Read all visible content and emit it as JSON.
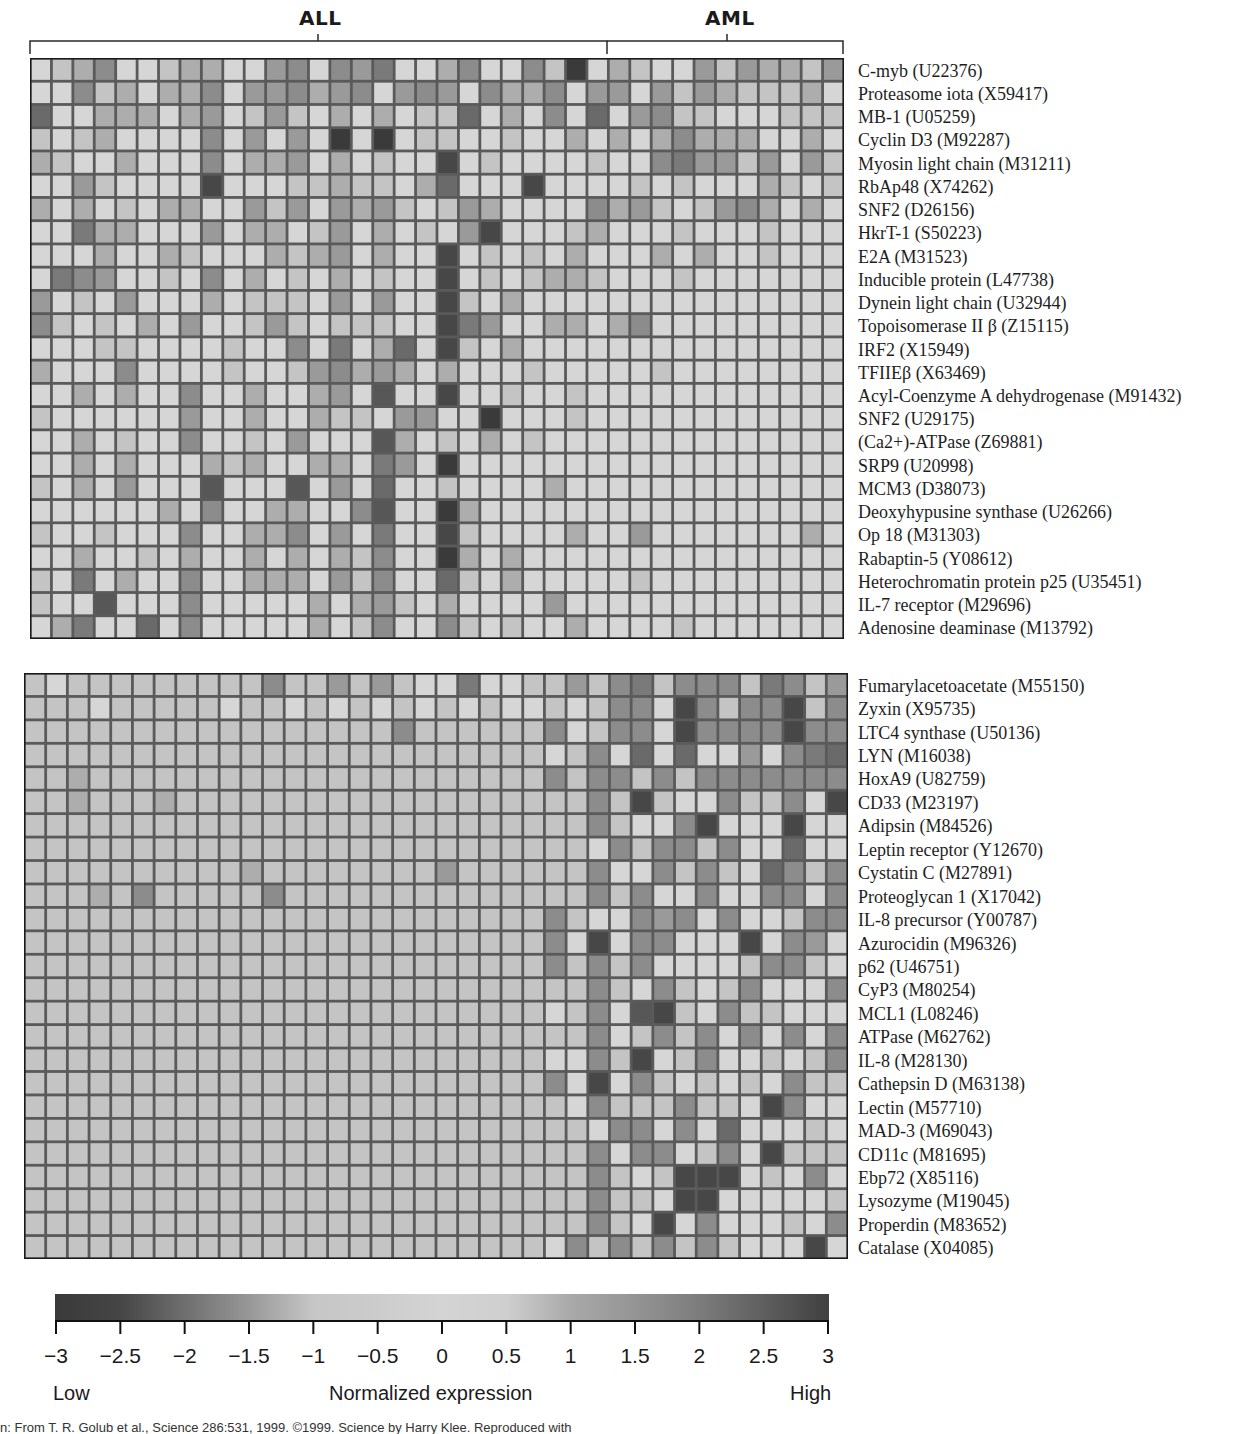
{
  "groups": {
    "left": {
      "label": "ALL",
      "n_columns": 27
    },
    "right": {
      "label": "AML",
      "n_columns": 11
    }
  },
  "top_panel": {
    "genes": [
      "C-myb (U22376)",
      "Proteasome iota (X59417)",
      "MB-1 (U05259)",
      "Cyclin D3 (M92287)",
      "Myosin light chain (M31211)",
      "RbAp48 (X74262)",
      "SNF2 (D26156)",
      "HkrT-1 (S50223)",
      "E2A (M31523)",
      "Inducible protein (L47738)",
      "Dynein light chain (U32944)",
      "Topoisomerase II β (Z15115)",
      "IRF2 (X15949)",
      "TFIIEβ (X63469)",
      "Acyl-Coenzyme A dehydrogenase (M91432)",
      "SNF2 (U29175)",
      "(Ca2+)-ATPase (Z69881)",
      "SRP9 (U20998)",
      "MCM3 (D38073)",
      "Deoxyhypusine synthase (U26266)",
      "Op 18 (M31303)",
      "Rabaptin-5 (Y08612)",
      "Heterochromatin protein p25 (U35451)",
      "IL-7 receptor (M29696)",
      "Adenosine deaminase (M13792)"
    ],
    "levels": [
      "0124001220034043500240041902100313221342",
      "0041202240334234034304224033031321112020",
      "6002220230131020201160204060341100011110",
      "1012000040303090901100100202024222002000",
      "2100200040223020100801000010045331303113",
      "0031000080001121102600080000101000210102",
      "2020102200313032310132000042310134202001",
      "0052200030220130201038000120001000100000",
      "0002002100021230200801010200020200100000",
      "0543001040201020100801012210001000000000",
      "3010300020111030300810200000000000000000",
      "4101020300131011100853002202400000000000",
      "0001100001004050260810200000000000000000",
      "2000400001001342320200010000010000000000",
      "0020200400200230700800100100000000000000",
      "1000000300200211033009000100000000000000",
      "0020100400103000720102010000000000000000",
      "0020200021200220530900000000000000000000",
      "1020300070007030600100002000000000000000",
      "0000002040022004700920000000000000000000",
      "1001000400224030500810000200300000002000",
      "0020010200202021400920200000000000000000",
      "1050200400222031400610200000100000000000",
      "1007000400000202310200003000000000000000",
      "0250060400000201400410100200001000000000"
    ]
  },
  "bottom_panel": {
    "genes": [
      "Fumarylacetoacetate (M55150)",
      "Zyxin (X95735)",
      "LTC4 synthase (U50136)",
      "LYN (M16038)",
      "HoxA9 (U82759)",
      "CD33 (M23197)",
      "Adipsin (M84526)",
      "Leptin receptor (Y12670)",
      "Cystatin C (M27891)",
      "Proteoglycan 1 (X17042)",
      "IL-8 precursor (Y00787)",
      "Azurocidin (M96326)",
      "p62 (U46751)",
      "CyP3 (M80254)",
      "MCL1 (L08246)",
      "ATPase (M62762)",
      "IL-8 (M28130)",
      "Cathepsin D (M63138)",
      "Lectin (M57710)",
      "MAD-3 (M69043)",
      "CD11c (M81695)",
      "Ebp72 (X85116)",
      "Lysozyme (M19045)",
      "Properdin (M83652)",
      "Catalase (X04085)"
    ],
    "levels": [
      "1011111111141131310050011314514441541359",
      "1110111110110101010101001014408414481444",
      "1111111111111111141111114014408444484401",
      "1111111111111111111111110140606003045609",
      "1121111111111111111111114144141444444444",
      "1121112111111111111111111141810041140844",
      "1111111111111111111111111141004800080011",
      "1111111111111111111111111104144140060034",
      "1111111111211111111311111140041410641401",
      "1112141111141111111111111141400400440434",
      "1111111111111111111111114100434040014414",
      "1111111111111111111111114080440008043001",
      "1111111111111111111111114141400001441001",
      "1111111111111111111111111141041014000448",
      "1111111111111111111111110140781041100048",
      "1111111111111111111111111140141404040411",
      "1111111111111111111111110041801400101448",
      "1111111111111111111111114080410101041110",
      "1111111111111111111111111041114110840048",
      "1111111111111111111111111104404060001040",
      "1111111111111111111111111140440140811140",
      "1111111111111111111111111141018880104044",
      "1111111111111111111111111141108800000108",
      "1111111111111111111111111141080400010400",
      "1111111111111111111111110414141410008000"
    ]
  },
  "colorbar": {
    "ticks": [
      "−3",
      "−2.5",
      "−2",
      "−1.5",
      "−1",
      "−0.5",
      "0",
      "0.5",
      "1",
      "1.5",
      "2",
      "2.5",
      "3"
    ],
    "low_label": "Low",
    "title": "Normalized expression",
    "high_label": "High",
    "stops": [
      "#3a3a3a",
      "#454545",
      "#6e6e6e",
      "#979797",
      "#c6c6c6",
      "#cccccc",
      "#d4d4d4",
      "#cfcfcf",
      "#a9a9a9",
      "#949494",
      "#7c7c7c",
      "#5e5e5e",
      "#404040"
    ]
  },
  "credit": "n: From T. R. Golub et al., Science 286:531, 1999. ©1999. Science by Harry Klee. Reproduced with",
  "chart_data": {
    "type": "heatmap",
    "title": "",
    "xlabel": "Samples",
    "ylabel": "Genes",
    "column_groups": [
      {
        "name": "ALL",
        "count": 27
      },
      {
        "name": "AML",
        "count": 11
      }
    ],
    "panels": [
      {
        "name": "ALL-high genes",
        "rows": 25,
        "cols": 38,
        "note": "Genes more highly expressed in ALL samples; one ALL column (~col 20) is uniformly dark."
      },
      {
        "name": "AML-high genes",
        "rows": 25,
        "cols": 38,
        "note": "Genes more highly expressed in AML samples; dark cells concentrated in last 11 columns."
      }
    ],
    "colorbar": {
      "label": "Normalized expression",
      "range": [
        -3,
        3
      ],
      "ticks": [
        -3,
        -2.5,
        -2,
        -1.5,
        -1,
        -0.5,
        0,
        0.5,
        1,
        1.5,
        2,
        2.5,
        3
      ],
      "low": "Low",
      "high": "High"
    },
    "encoding": "levels strings: one digit per column, 0 = lightest (≈ −0.5), 9 = darkest (≈ |3|)"
  }
}
